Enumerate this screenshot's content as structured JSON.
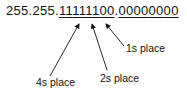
{
  "diagram": {
    "mask_prefix": "255.255.",
    "octet3_bits": [
      "1",
      "1",
      "1",
      "1",
      "1",
      "1",
      "0",
      "0"
    ],
    "separator": ".",
    "octet4_bits": [
      "0",
      "0",
      "0",
      "0",
      "0",
      "0",
      "0",
      "0"
    ],
    "labels": {
      "ones": "1s place",
      "twos": "2s place",
      "fours": "4s place"
    }
  }
}
